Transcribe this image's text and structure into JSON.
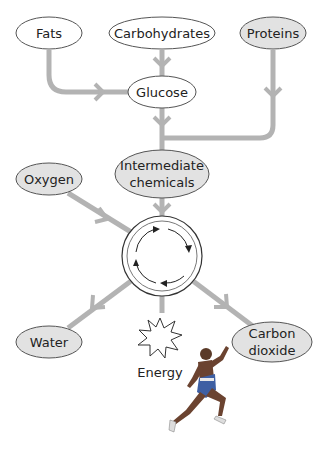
{
  "colors": {
    "arrow": "#b3b3b3",
    "ellipse_stroke": "#555555",
    "ellipse_fill_plain": "#ffffff",
    "ellipse_fill_shaded": "#e2e2e2"
  },
  "nodes": {
    "fats": "Fats",
    "carbohydrates": "Carbohydrates",
    "proteins": "Proteins",
    "glucose": "Glucose",
    "intermediate_line1": "Intermediate",
    "intermediate_line2": "chemicals",
    "oxygen": "Oxygen",
    "water": "Water",
    "carbon_line1": "Carbon",
    "carbon_line2": "dioxide",
    "energy": "Energy"
  },
  "icons": {
    "cycle": "cycle-arrows-icon",
    "energy": "starburst-icon",
    "runner": "runner-illustration"
  }
}
